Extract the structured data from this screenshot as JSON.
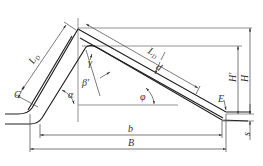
{
  "diagram": {
    "type": "cross-section dimension drawing",
    "colors": {
      "stroke": "#333333",
      "thin": "#555555",
      "background": "#ffffff"
    },
    "labels": {
      "LD_left": "L",
      "LD_left_sub": "D",
      "LD_right": "L",
      "LD_right_sub": "D",
      "C": "C",
      "alpha": "α",
      "beta_prime": "β'",
      "gamma": "γ",
      "d": "d",
      "phi": "φ",
      "E": "E",
      "H_prime": "H'",
      "H": "H",
      "s": "s",
      "b": "b",
      "B": "B"
    }
  }
}
